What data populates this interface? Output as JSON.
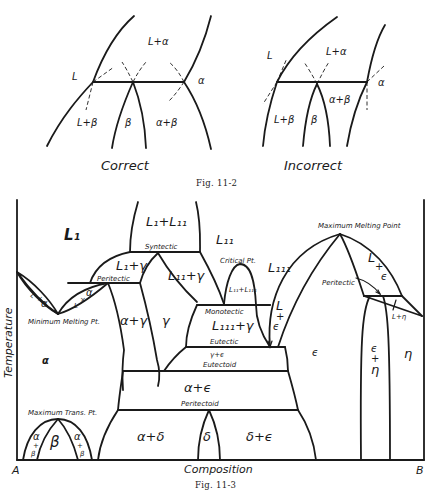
{
  "figure_11_2": {
    "caption": "Fig. 11-2",
    "correct": {
      "title": "Correct",
      "labels": {
        "L": "L",
        "L_alpha": "L+α",
        "alpha": "α",
        "L_beta": "L+β",
        "beta": "β",
        "alpha_beta": "α+β"
      }
    },
    "incorrect": {
      "title": "Incorrect",
      "labels": {
        "L": "L",
        "L_alpha": "L+α",
        "alpha": "α",
        "L_beta": "L+β",
        "beta": "β",
        "alpha_beta": "α+β"
      }
    }
  },
  "figure_11_3": {
    "caption": "Fig. 11-3",
    "axes": {
      "ylabel": "Temperature",
      "xlabel": "Composition",
      "left_end": "A",
      "right_end": "B"
    },
    "phases": {
      "L1": "L₁",
      "L1_L2": "L₁+L₁₁",
      "L2": "L₁₁",
      "L3": "L₁₁₁",
      "L_alpha_left_1": "L",
      "L_alpha_left_2": "α",
      "L_alpha_right_1": "L",
      "L_alpha_right_2": "α",
      "L1_gamma_top": "L₁+γ",
      "L2_gamma": "L₁₁+γ",
      "L2_L3": "L₁₁+L₁₁₁",
      "L3_gamma": "L₁₁₁+γ",
      "alpha_gamma": "α+γ",
      "gamma": "γ",
      "alpha": "α",
      "gamma_epsilon": "γ+ϵ",
      "alpha_epsilon": "α+ϵ",
      "alpha_delta": "α+δ",
      "delta": "δ",
      "delta_epsilon": "δ+ϵ",
      "epsilon": "ϵ",
      "L_epsilon_left_1": "L",
      "L_epsilon_left_2": "+",
      "L_epsilon_left_3": "ϵ",
      "L_epsilon_right_1": "L",
      "L_epsilon_right_2": "+",
      "L_epsilon_right_3": "ϵ",
      "epsilon_eta_1": "ϵ",
      "epsilon_eta_2": "+",
      "epsilon_eta_3": "η",
      "eta": "η",
      "L_eta": "L+η",
      "beta": "β",
      "alpha_beta_left_1": "α",
      "alpha_beta_left_2": "+",
      "alpha_beta_left_3": "β",
      "alpha_beta_right_1": "α",
      "alpha_beta_right_2": "+",
      "alpha_beta_right_3": "β"
    },
    "annotations": {
      "syntectic": "Syntectic",
      "peritectic_left": "Peritectic",
      "critical_pt": "Critical Pt.",
      "minimum_melting_pt": "Minimum Melting Pt.",
      "monotectic": "Monotectic",
      "eutectic": "Eutectic",
      "eutectoid": "Eutectoid",
      "peritectoid": "Peritectoid",
      "maximum_melting_point": "Maximum Melting Point",
      "peritectic_right": "Peritectic",
      "maximum_trans_pt": "Maximum Trans. Pt."
    }
  }
}
